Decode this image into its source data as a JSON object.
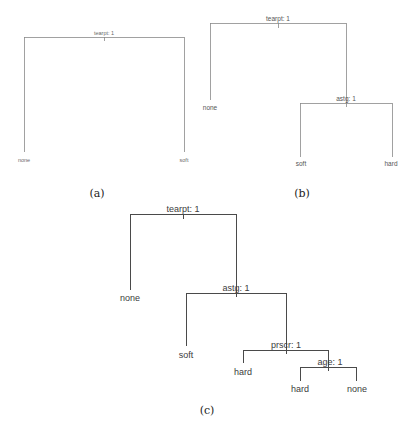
{
  "figure": {
    "panels": [
      {
        "caption": "(a)",
        "root": {
          "label": "tearpt: 1"
        },
        "leaves": [
          "none",
          "soft"
        ]
      },
      {
        "caption": "(b)",
        "root": {
          "label": "tearpt: 1"
        },
        "internal": [
          {
            "label": "astg: 1"
          }
        ],
        "leaves": [
          "none",
          "soft",
          "hard"
        ]
      },
      {
        "caption": "(c)",
        "root": {
          "label": "tearpt: 1"
        },
        "internal": [
          {
            "label": "astg: 1"
          },
          {
            "label": "prscr: 1"
          },
          {
            "label": "age: 1"
          }
        ],
        "leaves": [
          "none",
          "soft",
          "hard",
          "hard",
          "none"
        ]
      }
    ],
    "colors": {
      "edge": "#4a4a4a",
      "text": "#3a3a3a",
      "background": "#ffffff"
    }
  }
}
